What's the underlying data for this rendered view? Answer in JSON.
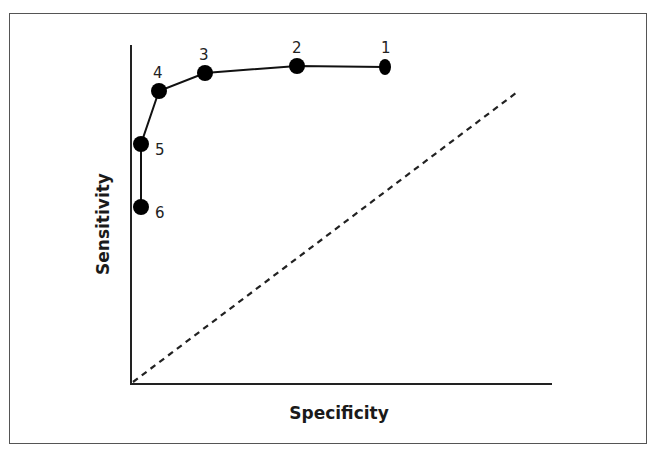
{
  "diagram": {
    "type": "roc-curve",
    "x_axis_label": "Specificity",
    "y_axis_label": "Sensitivity",
    "reference_line": "dashed diagonal (chance line)",
    "points": [
      {
        "label": "1",
        "px": 385,
        "py": 67
      },
      {
        "label": "2",
        "px": 297,
        "py": 66
      },
      {
        "label": "3",
        "px": 205,
        "py": 73
      },
      {
        "label": "4",
        "px": 159,
        "py": 91
      },
      {
        "label": "5",
        "px": 141,
        "py": 144
      },
      {
        "label": "6",
        "px": 141,
        "py": 207
      }
    ]
  }
}
